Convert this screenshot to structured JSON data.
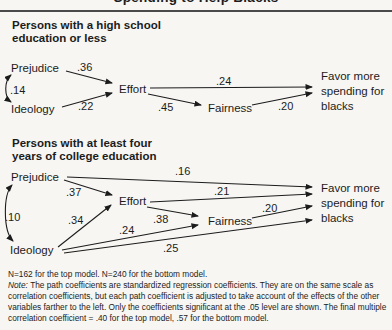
{
  "figure": {
    "clipped_title": "Spending to Help Blacks",
    "background": "#f7f6f3",
    "ink": "#1c1c1c"
  },
  "models": [
    {
      "heading_lines": [
        "Persons with a high school",
        "education or less"
      ],
      "nodes": {
        "exogenous1": "Prejudice",
        "exogenous2": "Ideology",
        "mediator1": "Effort",
        "mediator2": "Fairness"
      },
      "outcome_lines": [
        "Favor more",
        "spending for",
        "blacks"
      ],
      "paths": [
        {
          "from": "Prejudice",
          "to": "Ideology",
          "kind": "correlation",
          "coef": ".14"
        },
        {
          "from": "Prejudice",
          "to": "Effort",
          "kind": "direct",
          "coef": ".36"
        },
        {
          "from": "Ideology",
          "to": "Effort",
          "kind": "direct",
          "coef": ".22"
        },
        {
          "from": "Effort",
          "to": "Favor more spending for blacks",
          "kind": "direct",
          "coef": ".24"
        },
        {
          "from": "Effort",
          "to": "Fairness",
          "kind": "direct",
          "coef": ".45"
        },
        {
          "from": "Fairness",
          "to": "Favor more spending for blacks",
          "kind": "direct",
          "coef": ".20"
        }
      ]
    },
    {
      "heading_lines": [
        "Persons with at least four",
        "years of college education"
      ],
      "nodes": {
        "exogenous1": "Prejudice",
        "exogenous2": "Ideology",
        "mediator1": "Effort",
        "mediator2": "Fairness"
      },
      "outcome_lines": [
        "Favor more",
        "spending for",
        "blacks"
      ],
      "paths": [
        {
          "from": "Prejudice",
          "to": "Ideology",
          "kind": "correlation",
          "coef": ".10"
        },
        {
          "from": "Prejudice",
          "to": "Effort",
          "kind": "direct",
          "coef": ".37"
        },
        {
          "from": "Prejudice",
          "to": "Favor more spending for blacks",
          "kind": "direct",
          "coef": ".16"
        },
        {
          "from": "Ideology",
          "to": "Effort",
          "kind": "direct",
          "coef": ".34"
        },
        {
          "from": "Ideology",
          "to": "Fairness",
          "kind": "direct",
          "coef": ".24"
        },
        {
          "from": "Ideology",
          "to": "Favor more spending for blacks",
          "kind": "direct",
          "coef": ".25"
        },
        {
          "from": "Effort",
          "to": "Fairness",
          "kind": "direct",
          "coef": ".38"
        },
        {
          "from": "Effort",
          "to": "Favor more spending for blacks",
          "kind": "direct",
          "coef": ".21"
        },
        {
          "from": "Fairness",
          "to": "Favor more spending for blacks",
          "kind": "direct",
          "coef": ".20"
        }
      ]
    }
  ],
  "footnote": {
    "sample_line": "N=162 for the top model. N=240 for the bottom model.",
    "note_label": "Note: ",
    "note_text": "The path coefficients are standardized regression coefficients. They are on the same scale as correlation coefficients, but each path coefficient is adjusted to take account of the effects of the other variables farther to the left. Only the coefficients significant at the .05 level are shown. The final multiple correlation coefficient = .40 for the top model, .57 for the bottom model."
  }
}
